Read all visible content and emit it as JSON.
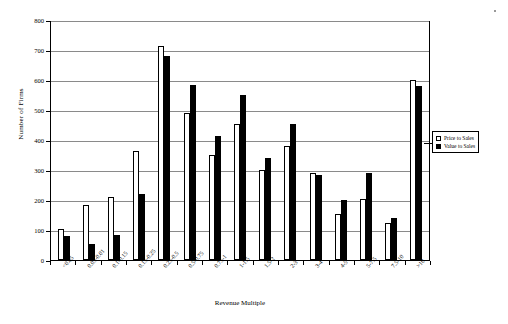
{
  "chart_data": {
    "type": "bar",
    "title": "",
    "xlabel": "Revenue Multiple",
    "ylabel": "Number of Firms",
    "ylim": [
      0,
      800
    ],
    "ytick_step": 100,
    "yticks": [
      0,
      100,
      200,
      300,
      400,
      500,
      600,
      700,
      800
    ],
    "grid": true,
    "legend_position": "right",
    "categories": [
      "<0.05",
      "0.05-0.01",
      "0.1-0.15",
      "0.15-0.25",
      "0.25-0.5",
      "0.5-0.75",
      "0.75-1",
      "1-1.5",
      "1.5-2",
      "2-3",
      "3-4",
      "4-5",
      "5-7.5",
      "7.5-10",
      ">10"
    ],
    "series": [
      {
        "name": "Price to Sales",
        "color": "#ffffff",
        "values": [
          105,
          185,
          210,
          365,
          715,
          490,
          350,
          455,
          300,
          380,
          290,
          155,
          205,
          125,
          600
        ]
      },
      {
        "name": "Value to Sales",
        "color": "#000000",
        "values": [
          80,
          55,
          85,
          220,
          680,
          585,
          415,
          550,
          340,
          455,
          285,
          200,
          290,
          140,
          580
        ]
      }
    ]
  },
  "legend": {
    "items": [
      {
        "label": "Price to Sales",
        "marker": "hollow-square"
      },
      {
        "label": "Value to Sales",
        "marker": "filled-square"
      }
    ]
  }
}
